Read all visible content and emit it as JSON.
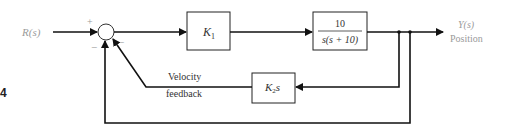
{
  "diagram": {
    "input_label": "R(s)",
    "output_label": "Y(s)",
    "output_sublabel": "Position",
    "figure_number": "4",
    "summing_junction": {
      "signs": {
        "input": "+",
        "inner_feedback": "−",
        "outer_feedback": "−"
      }
    },
    "blocks": {
      "controller": {
        "label": "K",
        "subscript": "1"
      },
      "plant": {
        "numerator": "10",
        "denominator": "s(s + 10)"
      },
      "velocity_feedback": {
        "label": "K",
        "subscript": "2",
        "suffix": "s"
      }
    },
    "annotations": {
      "velocity_line1": "Velocity",
      "velocity_line2": "feedback"
    }
  }
}
